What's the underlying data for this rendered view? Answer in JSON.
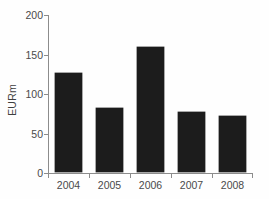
{
  "chart_data": {
    "type": "bar",
    "title": "",
    "subtitle": "",
    "xlabel": "",
    "ylabel": "EURm",
    "categories": [
      "2004",
      "2005",
      "2006",
      "2007",
      "2008"
    ],
    "values": [
      125,
      81,
      158,
      76,
      71
    ],
    "series": [
      {
        "name": "EURm",
        "values": [
          125,
          81,
          158,
          76,
          71
        ]
      }
    ],
    "ylim": [
      0,
      200
    ],
    "y_ticks": [
      0,
      50,
      100,
      150,
      200
    ],
    "y_tick_labels": [
      "0",
      "50",
      "100",
      "150",
      "200"
    ],
    "x_tick_labels": [
      "2004",
      "2005",
      "2006",
      "2007",
      "2008"
    ],
    "grid": false,
    "legend": false,
    "legend_position": "none",
    "bar_color": "#1c1c1c",
    "axis_color": "#8c8c8c",
    "text_color": "#4a4a4a",
    "background_color": "#fefefe",
    "annotations": []
  }
}
